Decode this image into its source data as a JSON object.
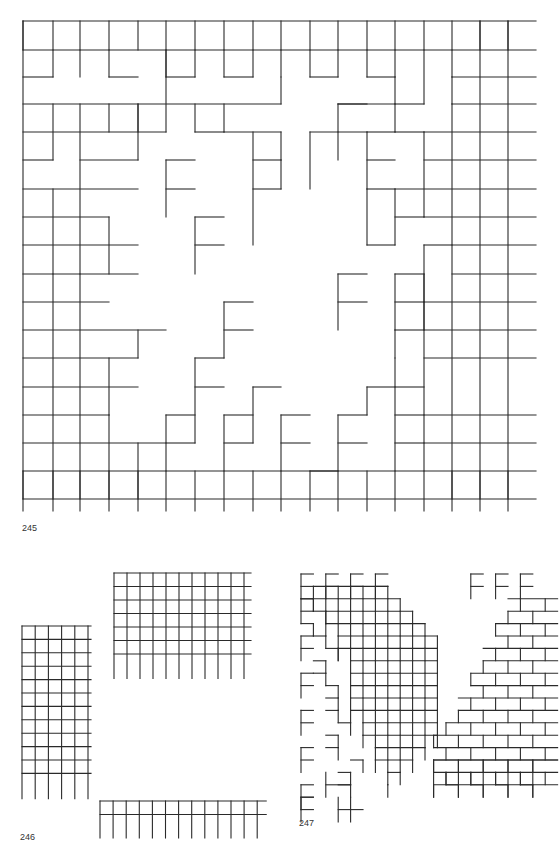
{
  "page": {
    "background": "#ffffff",
    "line_color": "#2a2a2a"
  },
  "figures": [
    {
      "id": "fig-245",
      "label": "245",
      "label_pos": [
        22,
        528
      ],
      "origin": [
        23,
        21
      ],
      "cell": [
        28.5,
        28.5
      ],
      "cols": 18,
      "rows": 9,
      "h_extend": 28,
      "description": "Large grid with stepped diamond-shaped void and isolated F-shaped segments"
    },
    {
      "id": "fig-246",
      "label": "246",
      "label_pos": [
        20,
        837
      ],
      "parts": [
        {
          "name": "tall-grid",
          "origin": [
            22,
            626
          ],
          "cell": [
            13.2,
            13.4
          ],
          "cols": 5,
          "rows": 12
        },
        {
          "name": "wide-grid",
          "origin": [
            114,
            573
          ],
          "cell": [
            13.0,
            13.5
          ],
          "cols": 10,
          "rows": 7
        },
        {
          "name": "strip-grid",
          "origin": [
            100,
            801
          ],
          "cell": [
            13.1,
            13.5
          ],
          "cols": 12,
          "rows": 2
        }
      ]
    },
    {
      "id": "fig-247",
      "label": "247",
      "label_pos": [
        299,
        823
      ],
      "description": "Two diagonal bands of small grids with F-shaped terminations"
    }
  ]
}
